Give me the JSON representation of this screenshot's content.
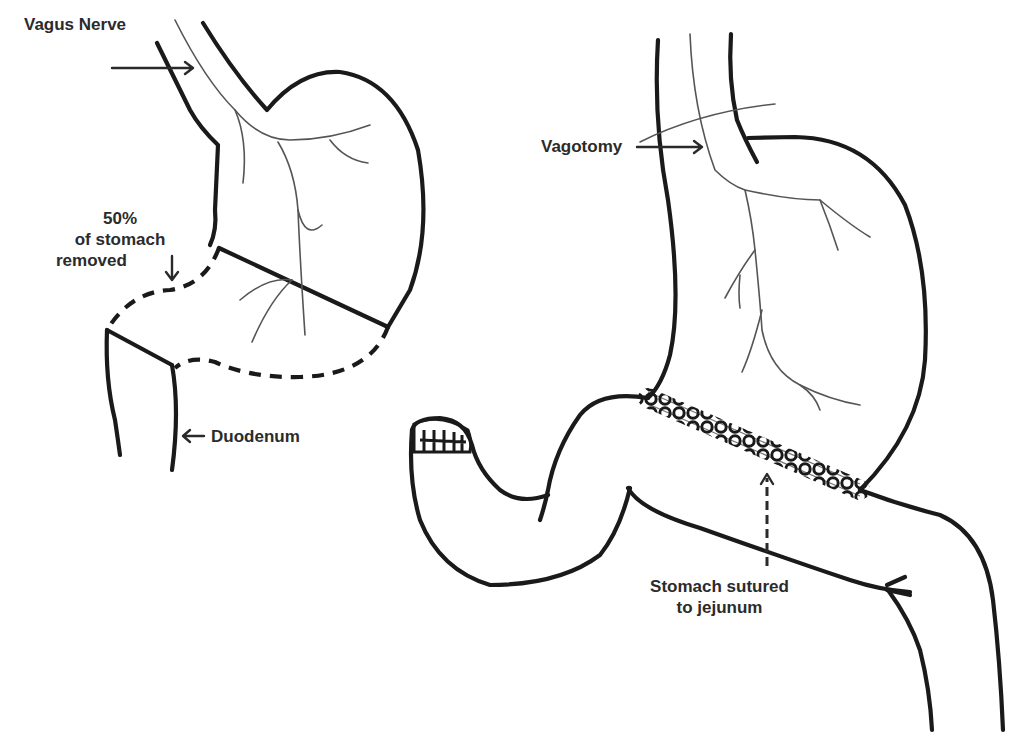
{
  "diagram": {
    "left_panel": {
      "labels": {
        "vagus_nerve": "Vagus Nerve",
        "percent_line1": "50%",
        "percent_line2": "of stomach",
        "percent_line3": "removed",
        "duodenum": "Duodenum"
      }
    },
    "right_panel": {
      "labels": {
        "vagotomy": "Vagotomy",
        "sutured_line1": "Stomach sutured",
        "sutured_line2": "to jejunum"
      }
    },
    "colors": {
      "outline": "#1a1a1a",
      "nerve": "#555555",
      "text": "#2b2b2b",
      "background": "#ffffff"
    }
  }
}
